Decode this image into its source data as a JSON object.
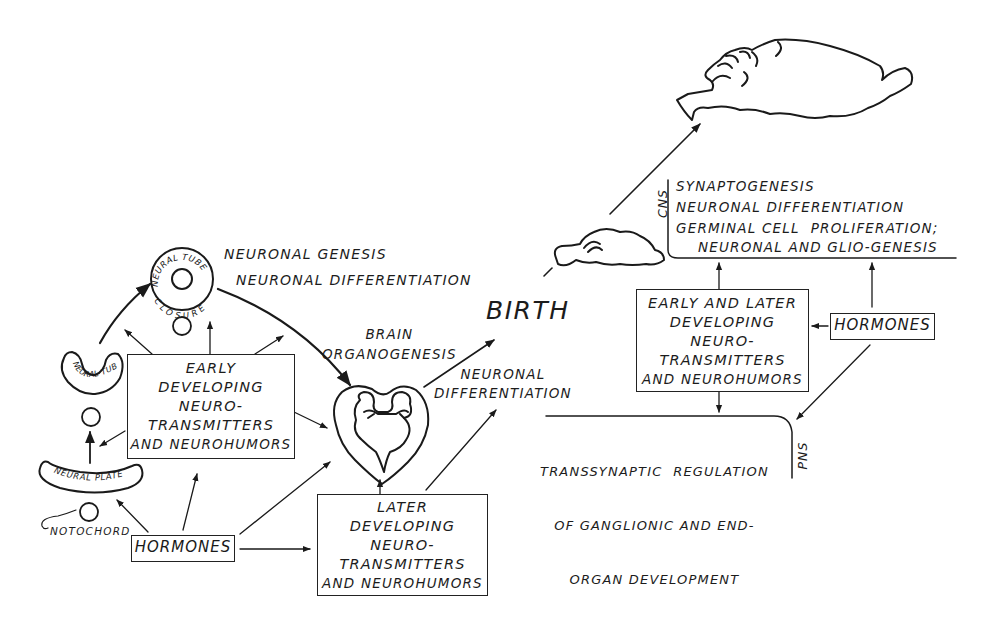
{
  "figure": {
    "birth_label": "BIRTH",
    "prenatal": {
      "neural_tube_closure": [
        "NEURAL TUBE",
        "CLOSURE"
      ],
      "neural_tube": "NEURAL TUBE",
      "neural_plate": "NEURAL PLATE",
      "notochord": "NOTOCHORD",
      "neuronal_genesis": "NEURONAL GENESIS",
      "neuronal_differentiation_top": "NEURONAL DIFFERENTIATION",
      "brain_organogenesis": [
        "BRAIN",
        "ORGANOGENESIS"
      ],
      "neuronal_differentiation_mid": [
        "NEURONAL",
        "DIFFERENTIATION"
      ],
      "early_box": [
        "EARLY",
        "DEVELOPING",
        "NEURO-",
        "TRANSMITTERS",
        "AND NEUROHUMORS"
      ],
      "hormones_box": "HORMONES",
      "later_box": [
        "LATER",
        "DEVELOPING",
        "NEURO-",
        "TRANSMITTERS",
        "AND NEUROHUMORS"
      ]
    },
    "postnatal": {
      "cns_label": "CNS",
      "cns_items": [
        "SYNAPTOGENESIS",
        "NEURONAL DIFFERENTIATION",
        "GERMINAL CELL  PROLIFERATION;",
        "NEURONAL AND GLIO-GENESIS"
      ],
      "early_later_box": [
        "EARLY AND LATER",
        "DEVELOPING",
        "NEURO-",
        "TRANSMITTERS",
        "AND NEUROHUMORS"
      ],
      "hormones_box": "HORMONES",
      "pns_label": "PNS",
      "pns_items": [
        "TRANSSYNAPTIC  REGULATION",
        "OF GANGLIONIC AND END-",
        "ORGAN DEVELOPMENT"
      ]
    }
  }
}
